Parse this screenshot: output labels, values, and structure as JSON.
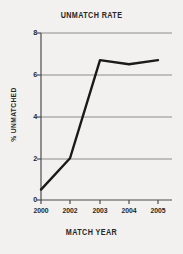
{
  "chart_data": {
    "type": "line",
    "title": "UNMATCH RATE",
    "xlabel": "MATCH YEAR",
    "ylabel": "% UNMATCHED",
    "categories": [
      "2000",
      "2002",
      "2003",
      "2004",
      "2005"
    ],
    "x": [
      2000,
      2002,
      2003,
      2004,
      2005
    ],
    "values": [
      0.5,
      2.0,
      6.7,
      6.5,
      6.7
    ],
    "series": [
      {
        "name": "% unmatched",
        "values": [
          0.5,
          2.0,
          6.7,
          6.5,
          6.7
        ]
      }
    ],
    "ylim": [
      0,
      8
    ],
    "yticks": [
      0,
      2,
      4,
      6,
      8
    ],
    "ytick_labels": [
      "0",
      "2",
      "4",
      "6",
      "8"
    ],
    "xtick_labels": [
      "2000",
      "2002",
      "2003",
      "2004",
      "2005"
    ],
    "grid": "horizontal",
    "legend": "none",
    "line_color": "#1a1a1a",
    "grid_color": "#8c8c8c",
    "axis_color": "#4d4d4d",
    "background_color": "#f2f1ef",
    "text_color": "#262626"
  }
}
